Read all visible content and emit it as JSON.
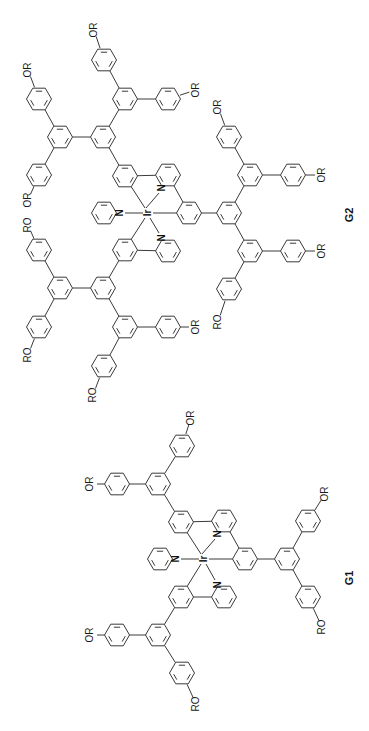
{
  "figure": {
    "orientation": "rotated 90 degrees clockwise",
    "line_color": "#3a3a3a",
    "background": "#ffffff"
  },
  "molecules": [
    {
      "id": "G2",
      "caption": "G2",
      "metal": "Ir",
      "ligand_atom": "N",
      "description": "Second-generation dendrimer: tris(2-phenylpyridine)iridium core with three second-generation 3,5-bis(aryl)phenyl dendrons",
      "terminal_groups": [
        "OR",
        "OR",
        "OR",
        "OR",
        "OR",
        "OR",
        "RO",
        "RO",
        "RO",
        "RO",
        "RO",
        "RO"
      ]
    },
    {
      "id": "G1",
      "caption": "G1",
      "metal": "Ir",
      "ligand_atom": "N",
      "description": "First-generation dendrimer: tris(2-phenylpyridine)iridium core with three 3,5-bis(4-alkoxyphenyl)phenyl dendrons",
      "terminal_groups": [
        "OR",
        "OR",
        "OR",
        "OR",
        "RO",
        "RO"
      ]
    }
  ],
  "labels": {
    "or": "OR",
    "ro": "RO",
    "or_ro": "OR RO",
    "metal": "Ir",
    "nitrogen": "N"
  }
}
